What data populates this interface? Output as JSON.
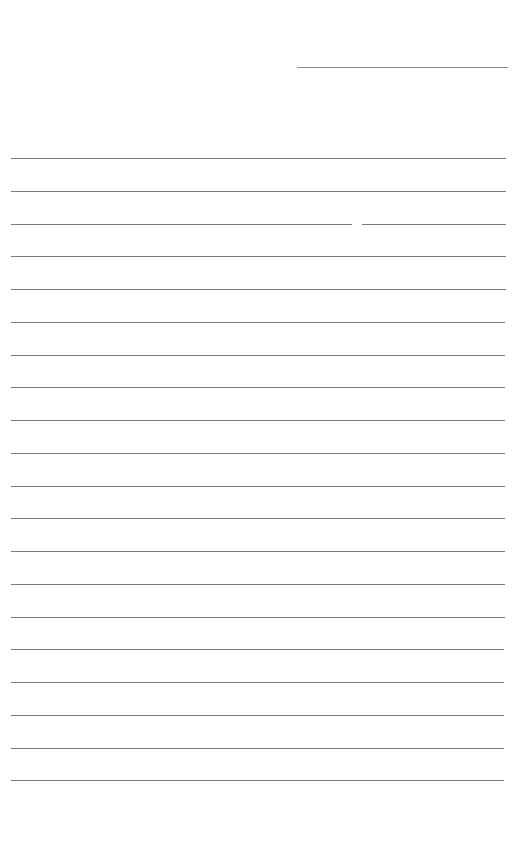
{
  "document": {
    "type": "lined-paper",
    "header": {
      "line_label": ""
    },
    "lines": [
      {
        "index": 1,
        "text": ""
      },
      {
        "index": 2,
        "text": ""
      },
      {
        "index": 3,
        "text": ""
      },
      {
        "index": 4,
        "text": ""
      },
      {
        "index": 5,
        "text": ""
      },
      {
        "index": 6,
        "text": ""
      },
      {
        "index": 7,
        "text": ""
      },
      {
        "index": 8,
        "text": ""
      },
      {
        "index": 9,
        "text": ""
      },
      {
        "index": 10,
        "text": ""
      },
      {
        "index": 11,
        "text": ""
      },
      {
        "index": 12,
        "text": ""
      },
      {
        "index": 13,
        "text": ""
      },
      {
        "index": 14,
        "text": ""
      },
      {
        "index": 15,
        "text": ""
      },
      {
        "index": 16,
        "text": ""
      },
      {
        "index": 17,
        "text": ""
      },
      {
        "index": 18,
        "text": ""
      },
      {
        "index": 19,
        "text": ""
      },
      {
        "index": 20,
        "text": ""
      }
    ],
    "line_count": 20,
    "colors": {
      "paper": "#ffffff",
      "rule": "#7d7d7d"
    }
  }
}
